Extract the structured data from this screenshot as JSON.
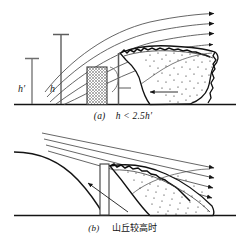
{
  "figure": {
    "title": "",
    "background_color": "#ffffff",
    "line_color": "#1a1a1a",
    "hatch_color": "#8a8a8a",
    "width": 246,
    "height": 241
  },
  "panel_a": {
    "caption_index": "(a)",
    "caption_text": "h < 2.5h′",
    "caption_full": "(a)  h < 2.5h′",
    "labels": {
      "h_prime": "h′",
      "h": "h"
    },
    "elements": {
      "ground_label": "ground-line",
      "building_label": "hatched-building",
      "streamline_count": 5,
      "arrowhead_count": 5,
      "separation_zone_label": "stippled-separation-zone",
      "recirculation_arrow_label": "reverse-flow-arrow"
    }
  },
  "panel_b": {
    "caption_index": "(b)",
    "caption_text": "山丘较高时",
    "caption_full": "(b)  山丘较高时",
    "elements": {
      "hill_label": "sloped-hill-profile",
      "building_label": "crest-building",
      "streamline_count": 4,
      "arrowhead_count": 4,
      "separation_zone_label": "stippled-separation-zone",
      "recirculation_arrow_label": "reverse-flow-arrow"
    }
  }
}
